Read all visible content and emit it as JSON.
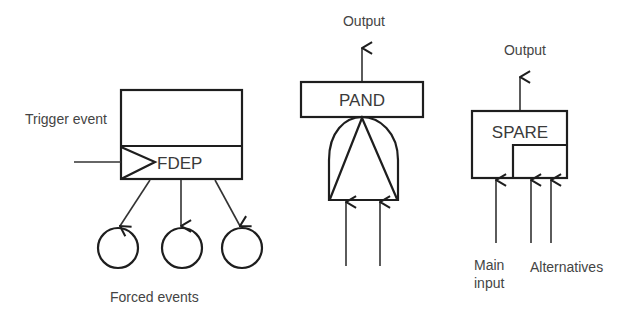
{
  "diagram": {
    "type": "fault-tree-dynamic-gates",
    "gates": [
      {
        "id": "fdep",
        "label": "FDEP",
        "annotations": {
          "trigger": "Trigger event",
          "outputs": "Forced events"
        },
        "forced_event_count": 3
      },
      {
        "id": "pand",
        "label": "PAND",
        "annotations": {
          "output": "Output"
        },
        "input_count": 2
      },
      {
        "id": "spare",
        "label": "SPARE",
        "annotations": {
          "output": "Output",
          "main_input_line1": "Main",
          "main_input_line2": "input",
          "alternatives": "Alternatives"
        },
        "alternative_count": 2
      }
    ]
  },
  "colors": {
    "line": "#1e1e1e",
    "text": "#444444",
    "background": "#ffffff"
  }
}
